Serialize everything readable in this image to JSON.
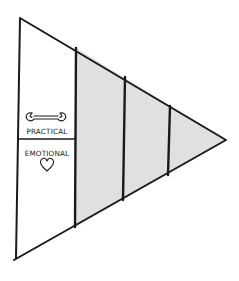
{
  "diagram": {
    "type": "funnel-triangle",
    "colors": {
      "stroke": "#1a1a1a",
      "shaded_fill": "#e0e0e0",
      "background": "#ffffff"
    },
    "left_section": {
      "top_label": "PRACTICAL",
      "top_icon": "wrench-icon",
      "bottom_label": "EMOTIONAL",
      "bottom_icon": "heart-icon"
    },
    "stages": [
      {
        "index": 1,
        "shaded": false
      },
      {
        "index": 2,
        "shaded": true
      },
      {
        "index": 3,
        "shaded": true
      },
      {
        "index": 4,
        "shaded": true
      }
    ]
  }
}
